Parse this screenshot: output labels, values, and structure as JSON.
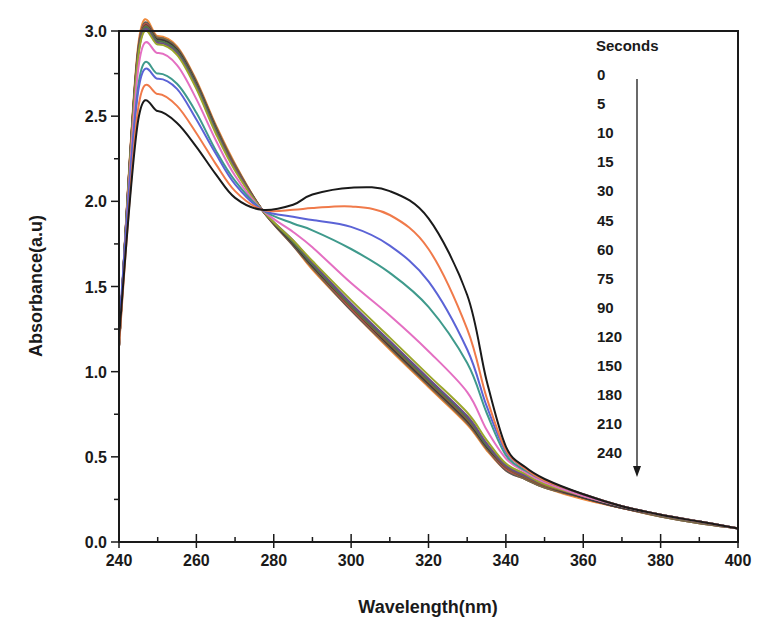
{
  "chart_data": {
    "type": "line",
    "title": "",
    "xlabel": "Wavelength(nm)",
    "ylabel": "Absorbance(a.u)",
    "xlim": [
      240,
      400
    ],
    "ylim": [
      0,
      3.0
    ],
    "x_ticks": [
      "240",
      "260",
      "280",
      "300",
      "320",
      "340",
      "360",
      "380",
      "400"
    ],
    "y_ticks": [
      "0.0",
      "0.5",
      "1.0",
      "1.5",
      "2.0",
      "2.5",
      "3.0"
    ],
    "grid": false,
    "legend": {
      "title": "Seconds",
      "position": "upper right (inside)",
      "entries": [
        "0",
        "5",
        "10",
        "15",
        "30",
        "45",
        "60",
        "75",
        "90",
        "120",
        "150",
        "180",
        "210",
        "240"
      ],
      "arrow": "downward arrow indicating increasing time"
    },
    "x": [
      240,
      245,
      250,
      255,
      260,
      265,
      270,
      277,
      285,
      290,
      300,
      310,
      320,
      330,
      335,
      340,
      345,
      350,
      360,
      370,
      380,
      390,
      400
    ],
    "series": [
      {
        "name": "0",
        "color": "#1a1a1a",
        "values": [
          1.2,
          2.48,
          2.53,
          2.46,
          2.32,
          2.16,
          2.02,
          1.95,
          1.98,
          2.04,
          2.08,
          2.06,
          1.9,
          1.45,
          0.95,
          0.56,
          0.44,
          0.37,
          0.28,
          0.21,
          0.16,
          0.12,
          0.08
        ]
      },
      {
        "name": "5",
        "color": "#f07a4a",
        "values": [
          1.15,
          2.55,
          2.63,
          2.56,
          2.4,
          2.22,
          2.06,
          1.95,
          1.95,
          1.96,
          1.97,
          1.92,
          1.72,
          1.25,
          0.85,
          0.54,
          0.43,
          0.36,
          0.28,
          0.21,
          0.16,
          0.12,
          0.08
        ]
      },
      {
        "name": "10",
        "color": "#5b63d6",
        "values": [
          1.25,
          2.65,
          2.72,
          2.66,
          2.48,
          2.28,
          2.1,
          1.95,
          1.91,
          1.89,
          1.85,
          1.74,
          1.53,
          1.13,
          0.8,
          0.53,
          0.43,
          0.36,
          0.28,
          0.21,
          0.16,
          0.12,
          0.08
        ]
      },
      {
        "name": "15",
        "color": "#3f9a8c",
        "values": [
          1.15,
          2.68,
          2.75,
          2.69,
          2.52,
          2.3,
          2.12,
          1.95,
          1.87,
          1.83,
          1.72,
          1.58,
          1.38,
          1.05,
          0.76,
          0.51,
          0.42,
          0.36,
          0.28,
          0.21,
          0.16,
          0.12,
          0.08
        ]
      },
      {
        "name": "30",
        "color": "#e46fc2",
        "values": [
          1.15,
          2.78,
          2.87,
          2.8,
          2.6,
          2.36,
          2.15,
          1.95,
          1.82,
          1.73,
          1.52,
          1.33,
          1.12,
          0.88,
          0.66,
          0.49,
          0.41,
          0.35,
          0.27,
          0.21,
          0.16,
          0.12,
          0.08
        ]
      },
      {
        "name": "45",
        "color": "#9aa62a",
        "values": [
          1.15,
          2.85,
          2.92,
          2.86,
          2.66,
          2.4,
          2.18,
          1.95,
          1.77,
          1.65,
          1.42,
          1.2,
          0.98,
          0.76,
          0.6,
          0.46,
          0.4,
          0.34,
          0.27,
          0.21,
          0.16,
          0.12,
          0.08
        ]
      },
      {
        "name": "60",
        "color": "#6a4a8a",
        "values": [
          1.15,
          2.86,
          2.93,
          2.87,
          2.67,
          2.41,
          2.19,
          1.95,
          1.77,
          1.64,
          1.4,
          1.18,
          0.96,
          0.74,
          0.58,
          0.45,
          0.39,
          0.34,
          0.27,
          0.21,
          0.16,
          0.12,
          0.08
        ]
      },
      {
        "name": "75",
        "color": "#4a7a4a",
        "values": [
          1.15,
          2.87,
          2.94,
          2.88,
          2.68,
          2.42,
          2.19,
          1.95,
          1.76,
          1.63,
          1.39,
          1.17,
          0.95,
          0.73,
          0.57,
          0.45,
          0.39,
          0.34,
          0.27,
          0.21,
          0.16,
          0.12,
          0.08
        ]
      },
      {
        "name": "90",
        "color": "#8a5a3a",
        "values": [
          1.15,
          2.88,
          2.94,
          2.88,
          2.68,
          2.42,
          2.2,
          1.95,
          1.76,
          1.63,
          1.38,
          1.16,
          0.94,
          0.72,
          0.57,
          0.44,
          0.38,
          0.33,
          0.27,
          0.21,
          0.16,
          0.12,
          0.08
        ]
      },
      {
        "name": "120",
        "color": "#3a3a3a",
        "values": [
          1.15,
          2.88,
          2.95,
          2.89,
          2.69,
          2.43,
          2.2,
          1.95,
          1.75,
          1.62,
          1.38,
          1.15,
          0.93,
          0.71,
          0.56,
          0.44,
          0.38,
          0.33,
          0.26,
          0.2,
          0.16,
          0.12,
          0.08
        ]
      },
      {
        "name": "150",
        "color": "#c0504a",
        "values": [
          1.15,
          2.89,
          2.95,
          2.89,
          2.69,
          2.43,
          2.2,
          1.95,
          1.75,
          1.62,
          1.37,
          1.15,
          0.93,
          0.71,
          0.56,
          0.43,
          0.38,
          0.33,
          0.26,
          0.2,
          0.16,
          0.12,
          0.08
        ]
      },
      {
        "name": "180",
        "color": "#7a6a4a",
        "values": [
          1.15,
          2.89,
          2.96,
          2.9,
          2.7,
          2.44,
          2.21,
          1.95,
          1.75,
          1.61,
          1.37,
          1.14,
          0.92,
          0.7,
          0.55,
          0.43,
          0.37,
          0.32,
          0.26,
          0.2,
          0.15,
          0.11,
          0.08
        ]
      },
      {
        "name": "210",
        "color": "#5a5a5a",
        "values": [
          1.15,
          2.9,
          2.96,
          2.9,
          2.7,
          2.44,
          2.21,
          1.95,
          1.74,
          1.61,
          1.36,
          1.14,
          0.92,
          0.7,
          0.55,
          0.42,
          0.37,
          0.32,
          0.26,
          0.2,
          0.15,
          0.11,
          0.08
        ]
      },
      {
        "name": "240",
        "color": "#f08a3a",
        "values": [
          1.15,
          2.92,
          2.97,
          2.91,
          2.71,
          2.45,
          2.22,
          1.95,
          1.74,
          1.6,
          1.36,
          1.13,
          0.91,
          0.69,
          0.54,
          0.42,
          0.37,
          0.32,
          0.25,
          0.2,
          0.15,
          0.11,
          0.08
        ]
      }
    ],
    "annotations": [
      "isosbestic point near 277 nm, ~1.95"
    ]
  },
  "plot_box": {
    "left": 119,
    "top": 31,
    "right": 738,
    "bottom": 542
  }
}
